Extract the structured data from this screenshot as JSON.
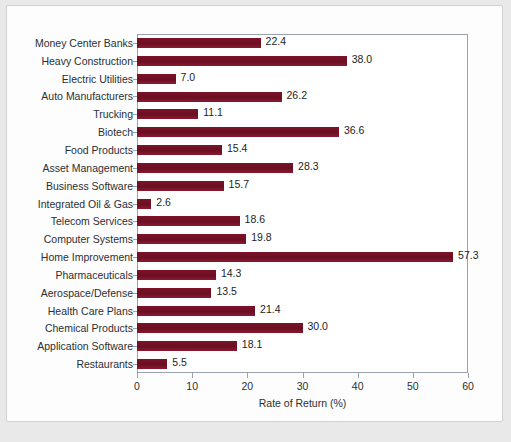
{
  "chart_data": {
    "type": "bar",
    "orientation": "horizontal",
    "title": "",
    "xlabel": "Rate of Return (%)",
    "ylabel": "",
    "xlim": [
      0,
      60
    ],
    "xticks": [
      0,
      10,
      20,
      30,
      40,
      50,
      60
    ],
    "grid": false,
    "legend": null,
    "bar_color": "#7b1028",
    "categories": [
      "Money Center Banks",
      "Heavy Construction",
      "Electric Utilities",
      "Auto Manufacturers",
      "Trucking",
      "Biotech",
      "Food Products",
      "Asset Management",
      "Business Software",
      "Integrated Oil & Gas",
      "Telecom Services",
      "Computer Systems",
      "Home Improvement",
      "Pharmaceuticals",
      "Aerospace/Defense",
      "Health Care Plans",
      "Chemical Products",
      "Application Software",
      "Restaurants"
    ],
    "values": [
      22.4,
      38.0,
      7.0,
      26.2,
      11.1,
      36.6,
      15.4,
      28.3,
      15.7,
      2.6,
      18.6,
      19.8,
      57.3,
      14.3,
      13.5,
      21.4,
      30.0,
      18.1,
      5.5
    ],
    "value_labels": [
      "22.4",
      "38.0",
      "7.0",
      "26.2",
      "11.1",
      "36.6",
      "15.4",
      "28.3",
      "15.7",
      "2.6",
      "18.6",
      "19.8",
      "57.3",
      "14.3",
      "13.5",
      "21.4",
      "30.0",
      "18.1",
      "5.5"
    ]
  },
  "figure": {
    "caption": ""
  }
}
